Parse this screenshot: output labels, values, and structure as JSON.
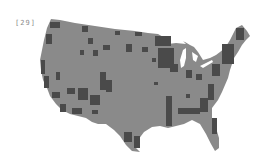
{
  "figure": {
    "label": "[29]",
    "colors": {
      "background": "#ffffff",
      "land": "#8a8a8a",
      "highlighted_counties": "#4a4a4a",
      "lakes": "#ffffff"
    }
  }
}
